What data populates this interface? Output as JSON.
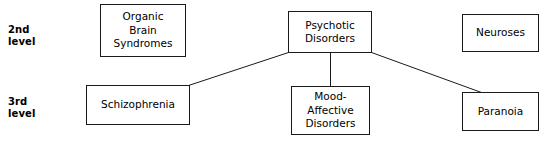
{
  "diagram": {
    "type": "hierarchy-tree",
    "background_color": "#ffffff",
    "line_color": "#1a1a1a",
    "text_color": "#000000",
    "level_labels": [
      {
        "id": "level-2",
        "line1": "2nd",
        "line2": "level",
        "text": "2nd\nlevel"
      },
      {
        "id": "level-3",
        "line1": "3rd",
        "line2": "level",
        "text": "3rd\nlevel"
      }
    ],
    "nodes": [
      {
        "id": "organic-brain-syndromes",
        "label": "Organic\nBrain\nSyndromes",
        "level": "2nd level"
      },
      {
        "id": "psychotic-disorders",
        "label": "Psychotic\nDisorders",
        "level": "2nd level"
      },
      {
        "id": "neuroses",
        "label": "Neuroses",
        "level": "2nd level"
      },
      {
        "id": "schizophrenia",
        "label": "Schizophrenia",
        "level": "3rd level"
      },
      {
        "id": "mood-affective-disorders",
        "label": "Mood-\nAffective\nDisorders",
        "level": "3rd level"
      },
      {
        "id": "paranoia",
        "label": "Paranoia",
        "level": "3rd level"
      }
    ],
    "edges": [
      {
        "from": "psychotic-disorders",
        "to": "schizophrenia"
      },
      {
        "from": "psychotic-disorders",
        "to": "mood-affective-disorders"
      },
      {
        "from": "psychotic-disorders",
        "to": "paranoia"
      }
    ]
  }
}
